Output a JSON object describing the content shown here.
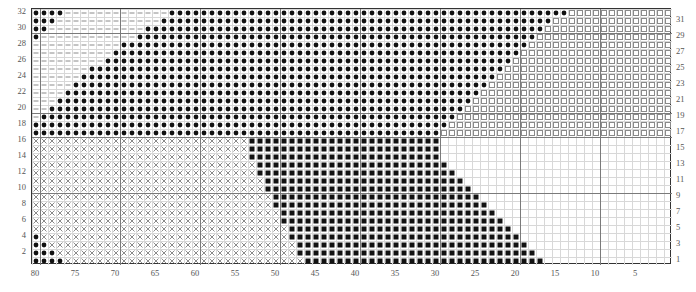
{
  "chart_data": {
    "type": "heatmap",
    "title": "",
    "xlabel": "",
    "ylabel": "",
    "grid": {
      "columns": 80,
      "rows": 32,
      "cell_px": 8,
      "bold_every": 10
    },
    "x_axis": {
      "position": "bottom",
      "direction": "descending-left-to-right",
      "range": [
        80,
        1
      ],
      "tick_labels": [
        "80",
        "75",
        "70",
        "65",
        "60",
        "55",
        "50",
        "45",
        "40",
        "35",
        "30",
        "25",
        "20",
        "15",
        "10",
        "5"
      ],
      "tick_values": [
        80,
        75,
        70,
        65,
        60,
        55,
        50,
        45,
        40,
        35,
        30,
        25,
        20,
        15,
        10,
        5
      ]
    },
    "y_axis_left": {
      "position": "left",
      "direction": "ascending-bottom-to-top",
      "tick_labels": [
        "2",
        "4",
        "6",
        "8",
        "10",
        "12",
        "14",
        "16",
        "18",
        "20",
        "22",
        "24",
        "26",
        "28",
        "30",
        "32"
      ],
      "tick_values": [
        2,
        4,
        6,
        8,
        10,
        12,
        14,
        16,
        18,
        20,
        22,
        24,
        26,
        28,
        30,
        32
      ]
    },
    "y_axis_right": {
      "position": "right",
      "direction": "ascending-bottom-to-top",
      "tick_labels": [
        "1",
        "3",
        "5",
        "7",
        "9",
        "11",
        "13",
        "15",
        "17",
        "19",
        "21",
        "23",
        "25",
        "27",
        "29",
        "31"
      ],
      "tick_values": [
        1,
        3,
        5,
        7,
        9,
        11,
        13,
        15,
        17,
        19,
        21,
        23,
        25,
        27,
        29,
        31
      ]
    },
    "symbols": [
      {
        "key": "dash",
        "glyph": "—",
        "name": "dash-symbol",
        "color": "#909090",
        "fill": "none"
      },
      {
        "key": "cross",
        "glyph": "×",
        "name": "cross-symbol",
        "color": "#8a8a8a",
        "fill": "none"
      },
      {
        "key": "dot",
        "glyph": "●",
        "name": "filled-dot-symbol",
        "color": "#111111",
        "fill": "solid"
      },
      {
        "key": "open_square",
        "glyph": "□",
        "name": "open-square-symbol",
        "color": "#8e8e8e",
        "fill": "none"
      },
      {
        "key": "full_square",
        "glyph": "■",
        "name": "filled-square-symbol",
        "color": "#111111",
        "fill": "solid"
      },
      {
        "key": "blank",
        "glyph": " ",
        "name": "empty-cell",
        "color": "#ffffff",
        "fill": "none"
      }
    ],
    "regions": [
      {
        "symbol": "dash",
        "rows": [
          17,
          32
        ],
        "note": "upper-left field of horizontal dashes, bounded on the right by the diagonal dot edge"
      },
      {
        "symbol": "cross",
        "rows": [
          1,
          16
        ],
        "note": "lower-left field of X marks, bounded on the right by the diagonal filled-square edge"
      },
      {
        "symbol": "dot",
        "rows": [
          17,
          32
        ],
        "note": "large black dot region, left edge diagonal rising from column 53 at row 17 to column 80 at row 32; right edge steps in from column 14 near row 32 to column 30 near row 18"
      },
      {
        "symbol": "open_square",
        "rows": [
          17,
          32
        ],
        "note": "open squares fill the upper-right corner beyond the dot region"
      },
      {
        "symbol": "full_square",
        "rows": [
          1,
          16
        ],
        "note": "black filled squares; left edge diagonal from column 53 at row 16 down to column 46 at row 1; right edge diagonal from column 30 at row 16 to column 17 at row 1"
      },
      {
        "symbol": "blank",
        "rows": [
          1,
          16
        ],
        "note": "empty white cells in the lower-right corner beyond the filled squares"
      }
    ],
    "row_spans": {
      "note": "Per-row column spans, columns counted from 80 at left to 1 at right.",
      "dot_left_col": [
        80,
        80,
        79,
        78,
        77,
        76,
        75,
        74,
        73,
        71,
        70,
        69,
        67,
        66,
        64,
        63
      ],
      "dot_right_col": [
        30,
        29,
        28,
        27,
        26,
        25,
        24,
        23,
        22,
        21,
        20,
        19,
        18,
        17,
        16,
        14
      ],
      "square_left_col": [
        46,
        47,
        47,
        48,
        48,
        49,
        49,
        50,
        50,
        51,
        51,
        52,
        52,
        53,
        53,
        53
      ],
      "square_right_col": [
        17,
        18,
        19,
        20,
        21,
        22,
        23,
        24,
        25,
        26,
        27,
        28,
        29,
        30,
        30,
        30
      ]
    },
    "colors": {
      "background": "#ffffff",
      "grid_light": "#d8d8d8",
      "grid_bold": "#7a7a7a",
      "border": "#333333",
      "symbol_dark": "#111111",
      "symbol_light": "#8a8a8a",
      "label": "#555555"
    }
  }
}
